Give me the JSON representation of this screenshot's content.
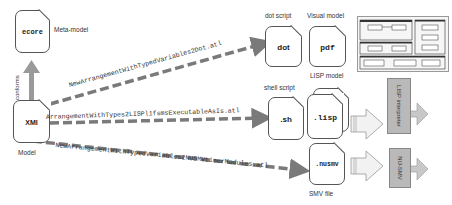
{
  "metamodel": {
    "label": "ecore",
    "caption": "Meta-model"
  },
  "model": {
    "label": "XMI",
    "caption": "Model"
  },
  "conforms_label": "conforms",
  "transformations": [
    {
      "name": "NewArrangementWithTypedVariables2Dot.atl"
    },
    {
      "name": "ArrangementWithTypes2LISPl1fsmsExecutableAsIs.atl"
    },
    {
      "name": "NewArrangementWithTypedVariables2NUSMVtimerModules.atl"
    }
  ],
  "outputs": {
    "dot": {
      "label": "dot",
      "caption": "dot script"
    },
    "pdf": {
      "label": "pdf",
      "caption": "Visual model"
    },
    "sh": {
      "label": ".sh",
      "caption": "shell script"
    },
    "lisp": {
      "label": ".lisp",
      "caption": "LISP model"
    },
    "nusmv": {
      "label": ".nusmv",
      "caption": "SMV file"
    }
  },
  "tools": {
    "lisp": {
      "label": "LISP interpreter"
    },
    "nusmv": {
      "label": "NU-SMV"
    }
  },
  "colors": {
    "arrow": "#7a7a7a",
    "tool_fill": "#b9b9b9",
    "doc_border": "#555555"
  }
}
